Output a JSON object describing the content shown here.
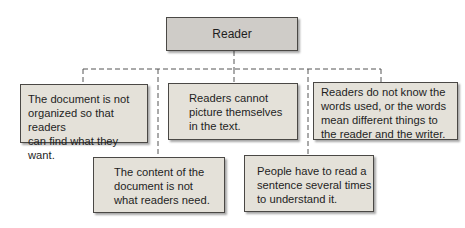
{
  "diagram": {
    "type": "tree",
    "root": {
      "id": "reader",
      "label": "Reader"
    },
    "children": [
      {
        "id": "not-organized",
        "label": "The document is not\norganized so that readers\ncan find what they want."
      },
      {
        "id": "wrong-content",
        "label": "The content of the\ndocument is not\nwhat readers need."
      },
      {
        "id": "cannot-picture",
        "label": "Readers cannot\npicture themselves\nin the text."
      },
      {
        "id": "read-several-times",
        "label": "People have to read a\nsentence several times\nto understand it."
      },
      {
        "id": "unknown-words",
        "label": "Readers do not know the\nwords used, or the words\nmean different things to\nthe reader and the writer."
      }
    ],
    "edges": [
      [
        "reader",
        "not-organized"
      ],
      [
        "reader",
        "wrong-content"
      ],
      [
        "reader",
        "cannot-picture"
      ],
      [
        "reader",
        "read-several-times"
      ],
      [
        "reader",
        "unknown-words"
      ]
    ],
    "colors": {
      "root_fill": "#cfccc8",
      "node_fill": "#e4e1d9",
      "border": "#4a4845",
      "connector": "#555555"
    }
  }
}
